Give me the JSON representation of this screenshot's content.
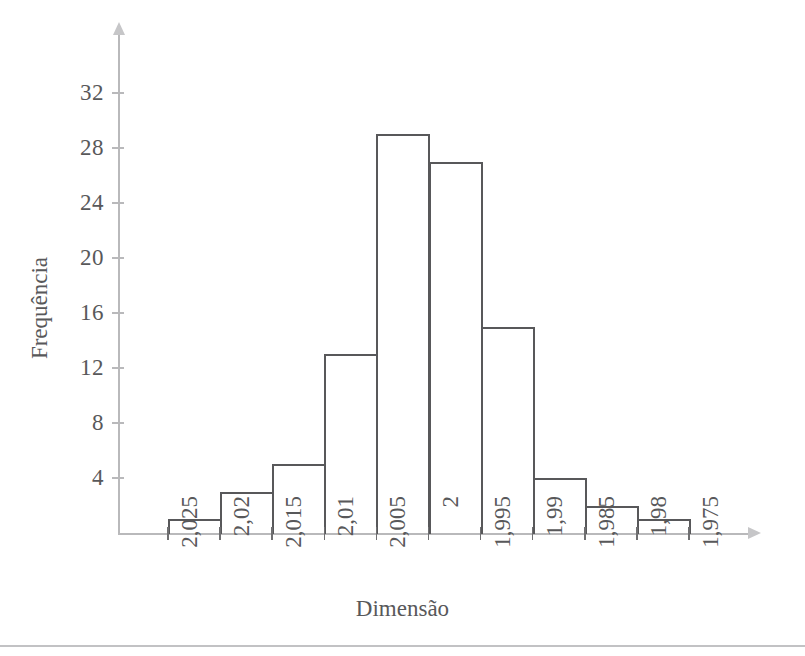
{
  "figure": {
    "axis_color": "#b9b9bb",
    "bar_color": "#58585a",
    "text_color": "#58585a"
  },
  "chart_data": {
    "type": "bar",
    "title": "",
    "subtitle": "",
    "xlabel": "Dimensão",
    "ylabel": "Frequência",
    "grid": false,
    "legend": null,
    "orientation": "vertical-histogram",
    "note": "Histograma de frequências; eixo x decrescente de 2,025 para 1,975",
    "bin_edges": [
      "2,025",
      "2,02",
      "2,015",
      "2,01",
      "2,005",
      "2",
      "1,995",
      "1,99",
      "1,985",
      "1,98",
      "1,975"
    ],
    "categories": [
      "2,025-2,02",
      "2,02-2,015",
      "2,015-2,01",
      "2,01-2,005",
      "2,005-2",
      "2-1,995",
      "1,995-1,99",
      "1,99-1,985",
      "1,985-1,98",
      "1,98-1,975"
    ],
    "values": [
      1,
      3,
      5,
      13,
      29,
      27,
      15,
      4,
      2,
      1
    ],
    "total": 100,
    "xlim": [
      "2,025",
      "1,975"
    ],
    "ylim": [
      0,
      34
    ],
    "ytick_values": [
      4,
      8,
      12,
      16,
      20,
      24,
      28,
      32
    ],
    "ytick_labels": [
      "4",
      "8",
      "12",
      "16",
      "20",
      "24",
      "28",
      "32"
    ],
    "xtick_labels": [
      "2,025",
      "2,02",
      "2,015",
      "2,01",
      "2,005",
      "2",
      "1,995",
      "1,99",
      "1,985",
      "1,98",
      "1,975"
    ]
  }
}
